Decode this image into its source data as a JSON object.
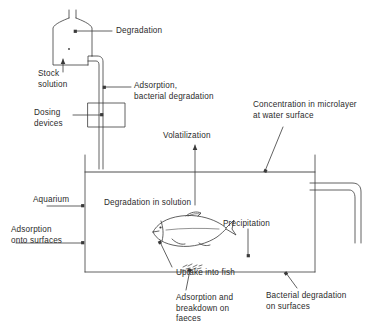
{
  "diagram": {
    "stroke_color": "#3a3a3a",
    "background_color": "#ffffff",
    "labels": {
      "degradation": "Degradation",
      "stock_solution": "Stock\nsolution",
      "adsorption_bacterial_degradation": "Adsorption,\nbacterial degradation",
      "dosing_devices": "Dosing\ndevices",
      "concentration_microlayer": "Concentration in microlayer\nat water surface",
      "volatilization": "Volatilization",
      "aquarium": "Aquarium",
      "degradation_in_solution": "Degradation in solution",
      "adsorption_onto_surfaces": "Adsorption\nonto surfaces",
      "precipitation": "Precipitation",
      "uptake_into_fish": "Uptake into fish",
      "adsorption_breakdown_faeces": "Adsorption and\nbreakdown on\nfaeces",
      "bacterial_degradation_surfaces": "Bacterial degradation\non surfaces"
    },
    "components": {
      "stock_flask": "stock-solution-flask",
      "dosing_box": "dosing-device-box",
      "feed_tube": "dosing-feed-tube",
      "aquarium_tank": "aquarium-tank",
      "water_surface": "water-surface-line",
      "fish": "fish-illustration",
      "faeces": "faeces-deposit",
      "outflow_pipe": "outflow-pipe"
    }
  }
}
